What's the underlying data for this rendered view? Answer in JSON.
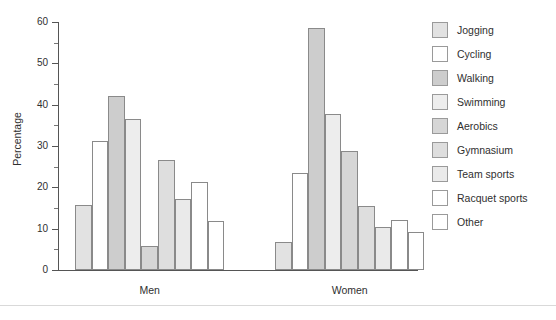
{
  "chart_data": {
    "type": "bar",
    "title": "",
    "subtitle": "",
    "xlabel": "",
    "ylabel": "Percentage",
    "ylim": [
      0,
      60
    ],
    "yticks": [
      0,
      10,
      20,
      30,
      40,
      50,
      60
    ],
    "ytick_labels": [
      "0",
      "10",
      "20",
      "30",
      "40",
      "50",
      "60"
    ],
    "yminor_step": 5,
    "grid": false,
    "legend_position": "right",
    "categories": [
      "Men",
      "Women"
    ],
    "series": [
      {
        "name": "Jogging",
        "color": "#e2e2e2",
        "values": [
          15.8,
          6.8
        ]
      },
      {
        "name": "Cycling",
        "color": "#ffffff",
        "values": [
          31.2,
          23.5
        ]
      },
      {
        "name": "Walking",
        "color": "#cdcdcd",
        "values": [
          42.0,
          58.5
        ]
      },
      {
        "name": "Swimming",
        "color": "#ededed",
        "values": [
          36.6,
          37.8
        ]
      },
      {
        "name": "Aerobics",
        "color": "#d6d6d6",
        "values": [
          5.9,
          28.9
        ]
      },
      {
        "name": "Gymnasium",
        "color": "#dedede",
        "values": [
          26.6,
          15.4
        ]
      },
      {
        "name": "Team sports",
        "color": "#eaeaea",
        "values": [
          17.3,
          10.3
        ]
      },
      {
        "name": "Racquet sports",
        "color": "#ffffff",
        "values": [
          21.3,
          12.2
        ]
      },
      {
        "name": "Other",
        "color": "#ffffff",
        "values": [
          11.8,
          9.3
        ]
      }
    ]
  },
  "legend": {
    "items": [
      {
        "label": "Jogging"
      },
      {
        "label": "Cycling"
      },
      {
        "label": "Walking"
      },
      {
        "label": "Swimming"
      },
      {
        "label": "Aerobics"
      },
      {
        "label": "Gymnasium"
      },
      {
        "label": "Team sports"
      },
      {
        "label": "Racquet sports"
      },
      {
        "label": "Other"
      }
    ]
  },
  "colors": {
    "axis": "#555555",
    "bar_border": "#8a8a8a",
    "text": "#2f2f2f",
    "background": "#ffffff",
    "footer_rule": "#d9d9d9"
  }
}
